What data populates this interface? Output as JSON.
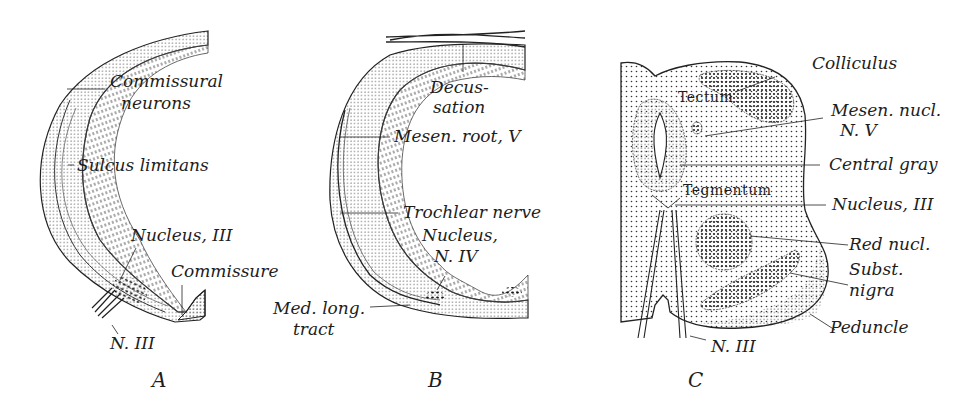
{
  "figure": {
    "panels": [
      {
        "id": "A",
        "letter": "A",
        "labels": {
          "commissural": "Commissural",
          "neurons": "neurons",
          "sulcus": "Sulcus limitans",
          "nucleus3": "Nucleus,  III",
          "commissure": "Commissure",
          "n3": "N. III"
        }
      },
      {
        "id": "B",
        "letter": "B",
        "labels": {
          "decus": "Decus-",
          "sation": "sation",
          "mesen_root": "Mesen. root, V",
          "trochlear": "Trochlear nerve",
          "nucleus": "Nucleus,",
          "n4": "N. IV",
          "med_long": "Med. long.",
          "tract": "tract"
        }
      },
      {
        "id": "C",
        "letter": "C",
        "labels": {
          "tectum": "Tectum",
          "tegmentum": "Tegmentum",
          "colliculus": "Colliculus",
          "mesen_nucl": "Mesen. nucl.",
          "nv": "N. V",
          "central_gray": "Central gray",
          "nucleus3": "Nucleus, III",
          "red_nucl": "Red nucl.",
          "subst": "Subst.",
          "nigra": "nigra",
          "peduncle": "Peduncle",
          "n3": "N. III"
        }
      }
    ],
    "colors": {
      "ink": "#1d1d1d",
      "background": "#ffffff"
    }
  }
}
